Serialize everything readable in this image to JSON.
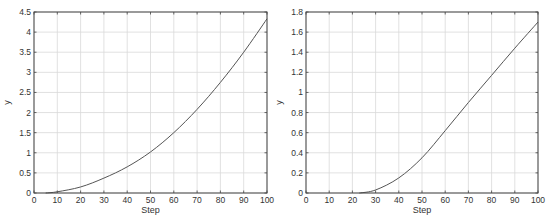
{
  "chart_data": [
    {
      "type": "line",
      "title": "",
      "xlabel": "Step",
      "ylabel": "y",
      "xlim": [
        0,
        100
      ],
      "ylim": [
        0,
        4.5
      ],
      "grid": true,
      "xticks": [
        0,
        10,
        20,
        30,
        40,
        50,
        60,
        70,
        80,
        90,
        100
      ],
      "yticks": [
        0,
        0.5,
        1,
        1.5,
        2,
        2.5,
        3,
        3.5,
        4,
        4.5
      ],
      "ytick_labels": [
        "0",
        "0.5",
        "1",
        "1.5",
        "2",
        "2.5",
        "3",
        "3.5",
        "4",
        "4.5"
      ],
      "series": [
        {
          "name": "y",
          "color": "#555555",
          "x": [
            5,
            10,
            20,
            30,
            40,
            50,
            60,
            70,
            80,
            90,
            100
          ],
          "values": [
            0,
            0.03,
            0.15,
            0.37,
            0.65,
            1.02,
            1.5,
            2.08,
            2.75,
            3.5,
            4.33
          ]
        }
      ]
    },
    {
      "type": "line",
      "title": "",
      "xlabel": "Step",
      "ylabel": "y",
      "xlim": [
        0,
        100
      ],
      "ylim": [
        0,
        1.8
      ],
      "grid": true,
      "xticks": [
        0,
        10,
        20,
        30,
        40,
        50,
        60,
        70,
        80,
        90,
        100
      ],
      "yticks": [
        0,
        0.2,
        0.4,
        0.6,
        0.8,
        1,
        1.2,
        1.4,
        1.6,
        1.8
      ],
      "ytick_labels": [
        "0",
        "0.2",
        "0.4",
        "0.6",
        "0.8",
        "1",
        "1.2",
        "1.4",
        "1.6",
        "1.8"
      ],
      "series": [
        {
          "name": "y",
          "color": "#555555",
          "x": [
            23,
            30,
            40,
            50,
            60,
            70,
            80,
            90,
            100
          ],
          "values": [
            0,
            0.03,
            0.15,
            0.35,
            0.62,
            0.9,
            1.17,
            1.44,
            1.7
          ]
        }
      ]
    }
  ],
  "colors": {
    "axes": "#444444",
    "grid": "#d9d9d9",
    "line": "#555555",
    "background": "#ffffff"
  }
}
